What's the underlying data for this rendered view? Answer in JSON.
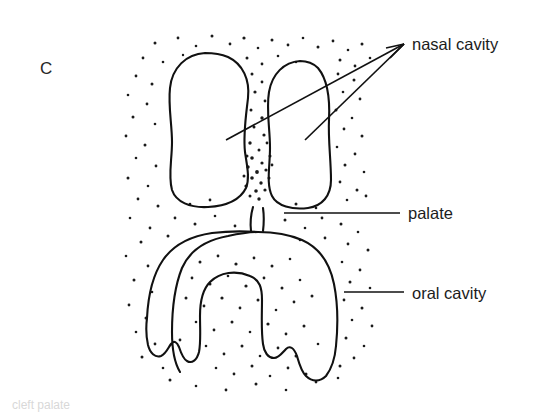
{
  "figure": {
    "panel_letter": "C",
    "type": "anatomical-line-drawing",
    "background_color": "#ffffff",
    "ink_color": "#111111",
    "text_color": "#1c1c1c"
  },
  "labels": [
    {
      "id": "nasal-cavity",
      "text": "nasal cavity",
      "x": 412,
      "y": 50,
      "leader_count": 2
    },
    {
      "id": "palate",
      "text": "palate",
      "x": 408,
      "y": 219,
      "leader_count": 1
    },
    {
      "id": "oral-cavity",
      "text": "oral cavity",
      "x": 412,
      "y": 299,
      "leader_count": 1
    }
  ],
  "caption": {
    "text": "cleft palate",
    "visible": "partially cropped at bottom edge"
  },
  "structures": [
    {
      "id": "nasal-cavity-left-lobe",
      "label": "nasal cavity (left lobe)"
    },
    {
      "id": "nasal-cavity-right-lobe",
      "label": "nasal cavity (right lobe)"
    },
    {
      "id": "nasal-septum",
      "label": "nasal septum"
    },
    {
      "id": "palate-stalk",
      "label": "palate"
    },
    {
      "id": "oral-cavity-arch",
      "label": "oral cavity"
    }
  ]
}
